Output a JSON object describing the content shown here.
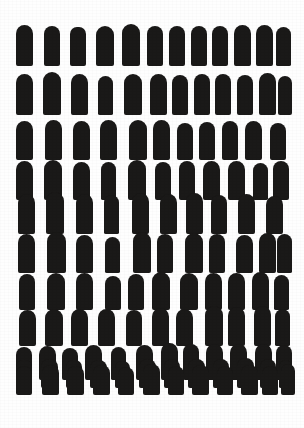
{
  "artwork": {
    "title": "Repeating Bullet Shape Pattern",
    "medium": "ink-on-paper pattern",
    "canvas": {
      "width": 304,
      "height": 428
    },
    "colors": {
      "ink": "#121110",
      "paper": "#fefefe"
    },
    "motif": {
      "name": "rounded-top-bullet",
      "description": "solid black vertical form with domed top and flat base"
    },
    "layout": {
      "row_count": 11,
      "total_shapes": 122,
      "margin_left": 16,
      "margin_right": 16,
      "margin_top": 24,
      "margin_bottom": 33
    },
    "rows": [
      {
        "index": 1,
        "count": 12,
        "top": 24,
        "shapes": [
          {
            "x": 16,
            "y": 25,
            "w": 17,
            "h": 41,
            "rt": 9
          },
          {
            "x": 44,
            "y": 26,
            "w": 16,
            "h": 40,
            "rt": 8
          },
          {
            "x": 70,
            "y": 27,
            "w": 16,
            "h": 39,
            "rt": 7
          },
          {
            "x": 96,
            "y": 26,
            "w": 18,
            "h": 40,
            "rt": 9
          },
          {
            "x": 122,
            "y": 24,
            "w": 18,
            "h": 42,
            "rt": 9
          },
          {
            "x": 147,
            "y": 26,
            "w": 16,
            "h": 40,
            "rt": 8
          },
          {
            "x": 169,
            "y": 26,
            "w": 16,
            "h": 40,
            "rt": 8
          },
          {
            "x": 191,
            "y": 26,
            "w": 16,
            "h": 40,
            "rt": 8
          },
          {
            "x": 212,
            "y": 26,
            "w": 16,
            "h": 40,
            "rt": 8
          },
          {
            "x": 234,
            "y": 25,
            "w": 17,
            "h": 41,
            "rt": 9
          },
          {
            "x": 256,
            "y": 25,
            "w": 17,
            "h": 41,
            "rt": 9
          },
          {
            "x": 276,
            "y": 27,
            "w": 15,
            "h": 39,
            "rt": 8
          }
        ]
      },
      {
        "index": 2,
        "count": 12,
        "top": 73,
        "shapes": [
          {
            "x": 16,
            "y": 74,
            "w": 17,
            "h": 41,
            "rt": 9
          },
          {
            "x": 43,
            "y": 72,
            "w": 18,
            "h": 43,
            "rt": 9
          },
          {
            "x": 71,
            "y": 74,
            "w": 17,
            "h": 41,
            "rt": 9
          },
          {
            "x": 98,
            "y": 76,
            "w": 15,
            "h": 39,
            "rt": 8
          },
          {
            "x": 124,
            "y": 74,
            "w": 18,
            "h": 41,
            "rt": 9
          },
          {
            "x": 150,
            "y": 74,
            "w": 17,
            "h": 41,
            "rt": 9
          },
          {
            "x": 172,
            "y": 75,
            "w": 16,
            "h": 40,
            "rt": 8
          },
          {
            "x": 194,
            "y": 74,
            "w": 16,
            "h": 41,
            "rt": 8
          },
          {
            "x": 215,
            "y": 74,
            "w": 16,
            "h": 41,
            "rt": 8
          },
          {
            "x": 237,
            "y": 75,
            "w": 16,
            "h": 40,
            "rt": 8
          },
          {
            "x": 259,
            "y": 73,
            "w": 17,
            "h": 42,
            "rt": 9
          },
          {
            "x": 278,
            "y": 76,
            "w": 14,
            "h": 39,
            "rt": 7
          }
        ]
      },
      {
        "index": 3,
        "count": 11,
        "top": 120,
        "shapes": [
          {
            "x": 16,
            "y": 121,
            "w": 17,
            "h": 39,
            "rt": 9
          },
          {
            "x": 45,
            "y": 120,
            "w": 17,
            "h": 40,
            "rt": 9
          },
          {
            "x": 73,
            "y": 121,
            "w": 17,
            "h": 39,
            "rt": 9
          },
          {
            "x": 100,
            "y": 120,
            "w": 17,
            "h": 40,
            "rt": 9
          },
          {
            "x": 129,
            "y": 120,
            "w": 18,
            "h": 40,
            "rt": 9
          },
          {
            "x": 153,
            "y": 120,
            "w": 17,
            "h": 40,
            "rt": 9
          },
          {
            "x": 177,
            "y": 123,
            "w": 16,
            "h": 37,
            "rt": 8
          },
          {
            "x": 199,
            "y": 122,
            "w": 16,
            "h": 38,
            "rt": 8
          },
          {
            "x": 222,
            "y": 121,
            "w": 16,
            "h": 39,
            "rt": 8
          },
          {
            "x": 245,
            "y": 121,
            "w": 17,
            "h": 39,
            "rt": 9
          },
          {
            "x": 270,
            "y": 123,
            "w": 16,
            "h": 37,
            "rt": 8
          }
        ]
      },
      {
        "index": 4,
        "count": 11,
        "top": 160,
        "shapes": [
          {
            "x": 16,
            "y": 161,
            "w": 17,
            "h": 39,
            "rt": 9
          },
          {
            "x": 44,
            "y": 160,
            "w": 18,
            "h": 40,
            "rt": 9
          },
          {
            "x": 73,
            "y": 162,
            "w": 17,
            "h": 38,
            "rt": 9
          },
          {
            "x": 101,
            "y": 162,
            "w": 15,
            "h": 38,
            "rt": 8
          },
          {
            "x": 128,
            "y": 160,
            "w": 18,
            "h": 40,
            "rt": 9
          },
          {
            "x": 155,
            "y": 162,
            "w": 16,
            "h": 38,
            "rt": 8
          },
          {
            "x": 179,
            "y": 161,
            "w": 16,
            "h": 39,
            "rt": 8
          },
          {
            "x": 203,
            "y": 161,
            "w": 17,
            "h": 39,
            "rt": 9
          },
          {
            "x": 228,
            "y": 161,
            "w": 17,
            "h": 39,
            "rt": 9
          },
          {
            "x": 253,
            "y": 163,
            "w": 15,
            "h": 37,
            "rt": 8
          },
          {
            "x": 273,
            "y": 161,
            "w": 16,
            "h": 39,
            "rt": 8
          }
        ]
      },
      {
        "index": 5,
        "count": 10,
        "top": 192,
        "shapes": [
          {
            "x": 18,
            "y": 194,
            "w": 17,
            "h": 40,
            "rt": 9
          },
          {
            "x": 46,
            "y": 192,
            "w": 18,
            "h": 42,
            "rt": 9
          },
          {
            "x": 76,
            "y": 194,
            "w": 17,
            "h": 40,
            "rt": 9
          },
          {
            "x": 104,
            "y": 195,
            "w": 15,
            "h": 39,
            "rt": 8
          },
          {
            "x": 132,
            "y": 193,
            "w": 17,
            "h": 41,
            "rt": 9
          },
          {
            "x": 160,
            "y": 194,
            "w": 17,
            "h": 40,
            "rt": 9
          },
          {
            "x": 186,
            "y": 193,
            "w": 17,
            "h": 41,
            "rt": 9
          },
          {
            "x": 211,
            "y": 195,
            "w": 16,
            "h": 39,
            "rt": 8
          },
          {
            "x": 238,
            "y": 194,
            "w": 17,
            "h": 40,
            "rt": 9
          },
          {
            "x": 266,
            "y": 196,
            "w": 17,
            "h": 38,
            "rt": 9
          }
        ]
      },
      {
        "index": 6,
        "count": 11,
        "top": 232,
        "shapes": [
          {
            "x": 18,
            "y": 234,
            "w": 17,
            "h": 39,
            "rt": 9
          },
          {
            "x": 47,
            "y": 232,
            "w": 19,
            "h": 41,
            "rt": 10
          },
          {
            "x": 76,
            "y": 235,
            "w": 17,
            "h": 38,
            "rt": 9
          },
          {
            "x": 105,
            "y": 237,
            "w": 15,
            "h": 36,
            "rt": 8
          },
          {
            "x": 133,
            "y": 232,
            "w": 18,
            "h": 41,
            "rt": 9
          },
          {
            "x": 157,
            "y": 234,
            "w": 16,
            "h": 39,
            "rt": 8
          },
          {
            "x": 185,
            "y": 233,
            "w": 18,
            "h": 40,
            "rt": 9
          },
          {
            "x": 209,
            "y": 234,
            "w": 16,
            "h": 39,
            "rt": 8
          },
          {
            "x": 236,
            "y": 235,
            "w": 17,
            "h": 38,
            "rt": 9
          },
          {
            "x": 259,
            "y": 233,
            "w": 17,
            "h": 40,
            "rt": 9
          },
          {
            "x": 277,
            "y": 234,
            "w": 15,
            "h": 39,
            "rt": 8
          }
        ]
      },
      {
        "index": 7,
        "count": 11,
        "top": 272,
        "shapes": [
          {
            "x": 19,
            "y": 274,
            "w": 16,
            "h": 36,
            "rt": 8
          },
          {
            "x": 47,
            "y": 273,
            "w": 18,
            "h": 37,
            "rt": 9
          },
          {
            "x": 76,
            "y": 273,
            "w": 17,
            "h": 37,
            "rt": 9
          },
          {
            "x": 105,
            "y": 276,
            "w": 16,
            "h": 34,
            "rt": 8
          },
          {
            "x": 128,
            "y": 274,
            "w": 16,
            "h": 36,
            "rt": 8
          },
          {
            "x": 152,
            "y": 272,
            "w": 18,
            "h": 38,
            "rt": 9
          },
          {
            "x": 180,
            "y": 273,
            "w": 18,
            "h": 37,
            "rt": 9
          },
          {
            "x": 205,
            "y": 273,
            "w": 17,
            "h": 37,
            "rt": 9
          },
          {
            "x": 228,
            "y": 273,
            "w": 17,
            "h": 37,
            "rt": 9
          },
          {
            "x": 252,
            "y": 272,
            "w": 17,
            "h": 38,
            "rt": 9
          },
          {
            "x": 274,
            "y": 275,
            "w": 15,
            "h": 35,
            "rt": 8
          }
        ]
      },
      {
        "index": 8,
        "count": 11,
        "top": 308,
        "shapes": [
          {
            "x": 19,
            "y": 310,
            "w": 17,
            "h": 36,
            "rt": 9
          },
          {
            "x": 45,
            "y": 309,
            "w": 18,
            "h": 37,
            "rt": 9
          },
          {
            "x": 71,
            "y": 309,
            "w": 17,
            "h": 37,
            "rt": 9
          },
          {
            "x": 98,
            "y": 309,
            "w": 17,
            "h": 37,
            "rt": 9
          },
          {
            "x": 126,
            "y": 310,
            "w": 16,
            "h": 36,
            "rt": 8
          },
          {
            "x": 152,
            "y": 308,
            "w": 17,
            "h": 38,
            "rt": 9
          },
          {
            "x": 176,
            "y": 309,
            "w": 17,
            "h": 37,
            "rt": 9
          },
          {
            "x": 205,
            "y": 306,
            "w": 18,
            "h": 40,
            "rt": 9
          },
          {
            "x": 228,
            "y": 307,
            "w": 17,
            "h": 39,
            "rt": 9
          },
          {
            "x": 254,
            "y": 306,
            "w": 17,
            "h": 40,
            "rt": 9
          },
          {
            "x": 275,
            "y": 309,
            "w": 15,
            "h": 37,
            "rt": 8
          }
        ]
      },
      {
        "index": 9,
        "count": 12,
        "top": 344,
        "shapes": [
          {
            "x": 16,
            "y": 347,
            "w": 16,
            "h": 33,
            "rt": 8
          },
          {
            "x": 39,
            "y": 346,
            "w": 17,
            "h": 34,
            "rt": 9
          },
          {
            "x": 62,
            "y": 348,
            "w": 16,
            "h": 32,
            "rt": 8
          },
          {
            "x": 85,
            "y": 345,
            "w": 17,
            "h": 35,
            "rt": 9
          },
          {
            "x": 111,
            "y": 347,
            "w": 15,
            "h": 33,
            "rt": 8
          },
          {
            "x": 136,
            "y": 345,
            "w": 17,
            "h": 35,
            "rt": 9
          },
          {
            "x": 161,
            "y": 343,
            "w": 17,
            "h": 37,
            "rt": 9
          },
          {
            "x": 183,
            "y": 344,
            "w": 16,
            "h": 36,
            "rt": 8
          },
          {
            "x": 206,
            "y": 344,
            "w": 17,
            "h": 36,
            "rt": 9
          },
          {
            "x": 230,
            "y": 344,
            "w": 17,
            "h": 36,
            "rt": 9
          },
          {
            "x": 255,
            "y": 344,
            "w": 17,
            "h": 36,
            "rt": 9
          },
          {
            "x": 276,
            "y": 345,
            "w": 16,
            "h": 35,
            "rt": 8
          }
        ]
      },
      {
        "index": 10,
        "count": 12,
        "top": 360,
        "shapes": [
          {
            "x": 16,
            "y": 360,
            "w": 16,
            "h": 28,
            "rt": 7
          },
          {
            "x": 41,
            "y": 359,
            "w": 17,
            "h": 29,
            "rt": 8
          },
          {
            "x": 66,
            "y": 360,
            "w": 16,
            "h": 28,
            "rt": 7
          },
          {
            "x": 90,
            "y": 360,
            "w": 17,
            "h": 28,
            "rt": 8
          },
          {
            "x": 115,
            "y": 361,
            "w": 15,
            "h": 27,
            "rt": 7
          },
          {
            "x": 139,
            "y": 359,
            "w": 17,
            "h": 29,
            "rt": 8
          },
          {
            "x": 164,
            "y": 359,
            "w": 16,
            "h": 29,
            "rt": 8
          },
          {
            "x": 188,
            "y": 359,
            "w": 17,
            "h": 29,
            "rt": 8
          },
          {
            "x": 213,
            "y": 359,
            "w": 16,
            "h": 29,
            "rt": 8
          },
          {
            "x": 237,
            "y": 358,
            "w": 17,
            "h": 30,
            "rt": 8
          },
          {
            "x": 260,
            "y": 359,
            "w": 16,
            "h": 29,
            "rt": 8
          },
          {
            "x": 279,
            "y": 360,
            "w": 13,
            "h": 28,
            "rt": 7
          }
        ]
      },
      {
        "index": 11,
        "count": 12,
        "top": 366,
        "shapes": [
          {
            "x": 16,
            "y": 366,
            "w": 16,
            "h": 29,
            "rt": 8
          },
          {
            "x": 42,
            "y": 365,
            "w": 17,
            "h": 30,
            "rt": 8
          },
          {
            "x": 67,
            "y": 366,
            "w": 17,
            "h": 29,
            "rt": 8
          },
          {
            "x": 93,
            "y": 365,
            "w": 17,
            "h": 30,
            "rt": 8
          },
          {
            "x": 118,
            "y": 367,
            "w": 16,
            "h": 28,
            "rt": 8
          },
          {
            "x": 143,
            "y": 364,
            "w": 17,
            "h": 31,
            "rt": 8
          },
          {
            "x": 168,
            "y": 366,
            "w": 16,
            "h": 29,
            "rt": 8
          },
          {
            "x": 192,
            "y": 365,
            "w": 17,
            "h": 30,
            "rt": 8
          },
          {
            "x": 217,
            "y": 366,
            "w": 16,
            "h": 29,
            "rt": 8
          },
          {
            "x": 241,
            "y": 365,
            "w": 17,
            "h": 30,
            "rt": 8
          },
          {
            "x": 262,
            "y": 366,
            "w": 16,
            "h": 29,
            "rt": 8
          },
          {
            "x": 281,
            "y": 364,
            "w": 14,
            "h": 31,
            "rt": 7
          }
        ]
      }
    ]
  }
}
